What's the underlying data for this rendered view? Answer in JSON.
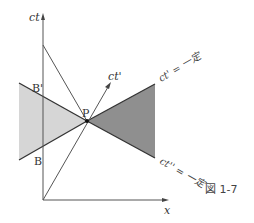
{
  "figure": {
    "caption": "図 1-7",
    "colors": {
      "light_region": "#d6d6d6",
      "dark_region": "#8f8f8f",
      "line": "#555555",
      "edge": "#333333"
    },
    "axes": {
      "vertical_label": "ct",
      "horizontal_label": "x",
      "moving_axis_label": "ct'"
    },
    "points": {
      "P": "P",
      "B_prime": "B'",
      "B": "B"
    },
    "lines": {
      "upper_label": "ct' = 一定",
      "lower_label": "ct'' = 一定"
    }
  }
}
